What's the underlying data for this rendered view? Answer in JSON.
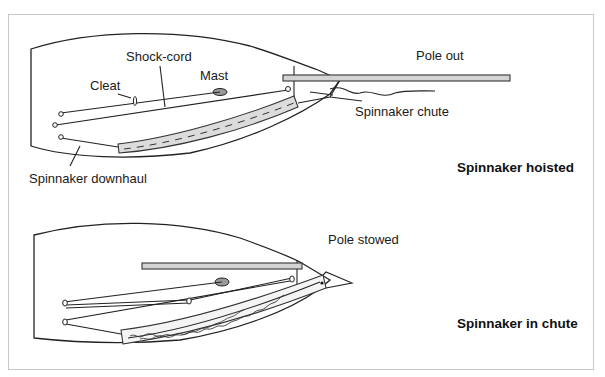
{
  "figure": {
    "panels": [
      {
        "id": "hoisted",
        "title": "Spinnaker hoisted",
        "labels": {
          "shock_cord": "Shock-cord",
          "mast": "Mast",
          "cleat": "Cleat",
          "pole": "Pole out",
          "chute": "Spinnaker chute",
          "downhaul": "Spinnaker downhaul"
        }
      },
      {
        "id": "in-chute",
        "title": "Spinnaker in chute",
        "labels": {
          "pole": "Pole stowed"
        }
      }
    ],
    "colors": {
      "line": "#222222",
      "pole_fill": "#d4d4d4",
      "chute_fill": "#dcdcdc",
      "frame_border": "#c8c8c8"
    }
  }
}
